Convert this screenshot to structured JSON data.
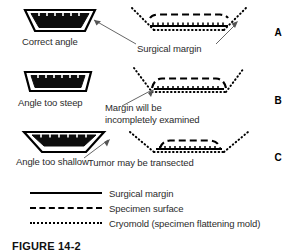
{
  "figure": {
    "background_color": "#ffffff",
    "ink_color": "#000000",
    "text_color": "#2b2b2b"
  },
  "panels": [
    {
      "letter": "A",
      "mold_label": "Correct angle",
      "annotation": "Surgical margin",
      "annotation_line2": "",
      "mold_icon": "cryomold-correct-angle-icon",
      "section_icon": "specimen-section-correct-icon"
    },
    {
      "letter": "B",
      "mold_label": "Angle too steep",
      "annotation": "Margin will be",
      "annotation_line2": "incompletely examined",
      "mold_icon": "cryomold-too-steep-icon",
      "section_icon": "specimen-section-steep-icon"
    },
    {
      "letter": "C",
      "mold_label": "Angle too shallow",
      "annotation": "Tumor may be transected",
      "annotation_line2": "",
      "mold_icon": "cryomold-too-shallow-icon",
      "section_icon": "specimen-section-shallow-icon"
    }
  ],
  "legend": {
    "items": [
      {
        "style": "solid",
        "label": "Surgical margin"
      },
      {
        "style": "dashed",
        "label": "Specimen surface"
      },
      {
        "style": "dotted",
        "label": "Cryomold (specimen flattening mold)"
      }
    ]
  },
  "caption": {
    "text": "FIGURE 14-2"
  }
}
